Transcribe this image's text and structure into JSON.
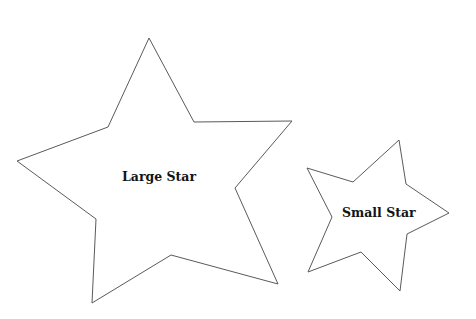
{
  "diagram": {
    "background": "#ffffff",
    "stroke_color": "#5a5a5a",
    "text_color": "#141414",
    "shapes": [
      {
        "id": "large-star",
        "type": "star",
        "label": "Large Star",
        "points": "149,38 194,122 292,121 235,188 278,284 171,255 92,303 96,219 17,161 108,127"
      },
      {
        "id": "small-star",
        "type": "star",
        "label": "Small Star",
        "points": "399,140 406,184 449,213 407,234 400,291 361,252 308,272 332,217 307,168 353,182"
      }
    ]
  }
}
